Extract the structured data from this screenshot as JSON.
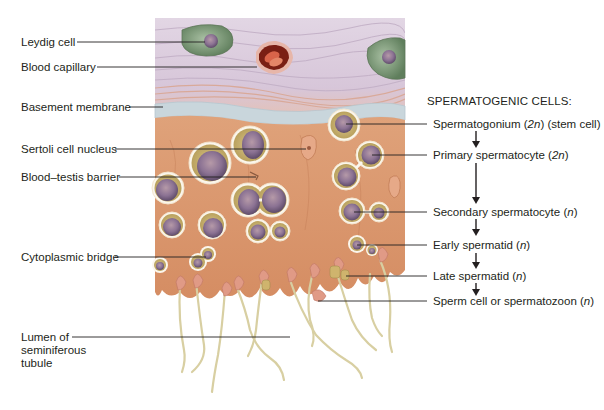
{
  "left_labels": [
    {
      "id": "leydig",
      "text": "Leydig cell",
      "x": 21,
      "y": 36
    },
    {
      "id": "capillary",
      "text": "Blood capillary",
      "x": 21,
      "y": 61
    },
    {
      "id": "basement",
      "text": "Basement membrane",
      "x": 21,
      "y": 101
    },
    {
      "id": "sertoli",
      "text": "Sertoli cell nucleus",
      "x": 21,
      "y": 143
    },
    {
      "id": "btb",
      "text": "Blood–testis barrier",
      "x": 21,
      "y": 171
    },
    {
      "id": "bridge",
      "text": "Cytoplasmic bridge",
      "x": 21,
      "y": 251
    }
  ],
  "lumen_label": {
    "line1": "Lumen of",
    "line2": "seminiferous",
    "line3": "tubule"
  },
  "right_panel": {
    "title": "SPERMATOGENIC CELLS:",
    "stages": [
      {
        "name": "Spermatogonium",
        "ploidy": "2n",
        "note": "(stem cell)"
      },
      {
        "name": "Primary spermatocyte",
        "ploidy": "2n",
        "note": ""
      },
      {
        "name": "Secondary spermatocyte",
        "ploidy": "n",
        "note": ""
      },
      {
        "name": "Early spermatid",
        "ploidy": "n",
        "note": ""
      },
      {
        "name": "Late spermatid",
        "ploidy": "n",
        "note": ""
      },
      {
        "name": "Sperm cell or spermatozoon",
        "ploidy": "n",
        "note": ""
      }
    ]
  },
  "colors": {
    "interstitium": "#d9c9dc",
    "membrane": "#c9d6dc",
    "epithelium": "#d9956a",
    "leydig": "#7d9a78",
    "capillary": "#7a1f14",
    "nucleus": "#8a7596",
    "tail": "#d8cfa2"
  }
}
